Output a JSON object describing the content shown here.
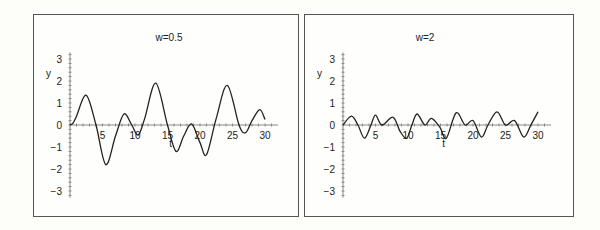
{
  "chart_data": [
    {
      "type": "line",
      "title": "w=0.5",
      "xlabel": "t",
      "ylabel": "y",
      "xlim": [
        0,
        30
      ],
      "ylim": [
        -3,
        3
      ],
      "x_ticks": [
        "5",
        "10",
        "15",
        "20",
        "25",
        "30"
      ],
      "y_ticks": [
        "3",
        "2",
        "1",
        "0",
        "-1",
        "-2",
        "-3"
      ],
      "grid": false,
      "legend": "none",
      "series": [
        {
          "name": "y(t), w=0.5",
          "x": [
            0,
            0.5,
            1,
            2.5,
            4,
            5.5,
            7,
            8.3,
            9.5,
            10.5,
            11.5,
            13.2,
            15,
            16.3,
            17.5,
            18.7,
            20,
            21,
            22.5,
            24.2,
            26,
            27,
            28,
            29.2,
            30
          ],
          "y": [
            0,
            0.1,
            0.4,
            1.35,
            0,
            -1.8,
            -0.5,
            0.5,
            0,
            -0.45,
            0.3,
            1.9,
            0,
            -1.2,
            -0.5,
            0.05,
            -0.8,
            -1.35,
            0.3,
            1.8,
            0,
            -0.35,
            0.2,
            0.7,
            0.25
          ]
        }
      ]
    },
    {
      "type": "line",
      "title": "w=2",
      "xlabel": "t",
      "ylabel": "y",
      "xlim": [
        0,
        30
      ],
      "ylim": [
        -3,
        3
      ],
      "x_ticks": [
        "5",
        "10",
        "15",
        "20",
        "25",
        "30"
      ],
      "y_ticks": [
        "3",
        "2",
        "1",
        "0",
        "-1",
        "-2",
        "-3"
      ],
      "grid": false,
      "legend": "none",
      "series": [
        {
          "name": "y(t), w=2",
          "x": [
            0,
            1.3,
            2.3,
            3.3,
            4.3,
            5,
            6,
            7.7,
            8.8,
            9.8,
            10.6,
            11.4,
            12.6,
            13.6,
            14.9,
            15.9,
            17.4,
            18.8,
            20,
            21.3,
            22.3,
            23.7,
            25,
            26.4,
            27.8,
            28.9,
            30
          ],
          "y": [
            0,
            0.4,
            0,
            -0.6,
            0,
            0.45,
            0,
            0.35,
            -0.3,
            -0.6,
            0,
            0.5,
            0,
            0.3,
            -0.1,
            -0.6,
            0.55,
            0,
            0.2,
            -0.55,
            0,
            0.6,
            0,
            0.2,
            -0.55,
            0,
            0.6
          ]
        }
      ]
    }
  ]
}
